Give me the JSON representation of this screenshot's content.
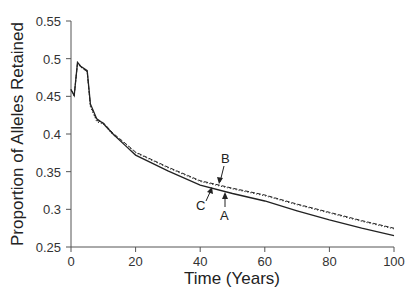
{
  "chart_data": {
    "type": "line",
    "title": "",
    "xlabel": "Time (Years)",
    "ylabel": "Proportion of Alleles Retained",
    "xlim": [
      0,
      100
    ],
    "ylim": [
      0.25,
      0.55
    ],
    "xticks": [
      0,
      20,
      40,
      60,
      80,
      100
    ],
    "yticks": [
      0.25,
      0.3,
      0.35,
      0.4,
      0.45,
      0.5,
      0.55
    ],
    "xtick_labels": [
      "0",
      "20",
      "40",
      "60",
      "80",
      "100"
    ],
    "ytick_labels": [
      "0.25",
      "0.3",
      "0.35",
      "0.4",
      "0.45",
      "0.5",
      "0.55"
    ],
    "grid": false,
    "legend": null,
    "x": [
      0,
      1,
      2,
      3,
      5,
      6,
      8,
      10,
      13,
      17,
      20,
      30,
      40,
      50,
      60,
      70,
      80,
      90,
      100
    ],
    "series": [
      {
        "name": "A",
        "style": "solid",
        "values": [
          0.459,
          0.451,
          0.495,
          0.49,
          0.484,
          0.44,
          0.42,
          0.414,
          0.4,
          0.384,
          0.372,
          0.351,
          0.332,
          0.321,
          0.311,
          0.298,
          0.286,
          0.275,
          0.265
        ]
      },
      {
        "name": "B",
        "style": "dashed",
        "values": [
          0.459,
          0.451,
          0.494,
          0.489,
          0.483,
          0.438,
          0.418,
          0.415,
          0.401,
          0.387,
          0.376,
          0.356,
          0.338,
          0.328,
          0.319,
          0.307,
          0.296,
          0.285,
          0.275
        ]
      },
      {
        "name": "C",
        "style": "dotted",
        "values": [
          0.459,
          0.451,
          0.494,
          0.489,
          0.482,
          0.436,
          0.416,
          0.413,
          0.399,
          0.386,
          0.375,
          0.355,
          0.337,
          0.327,
          0.318,
          0.306,
          0.295,
          0.284,
          0.274
        ]
      }
    ],
    "annotations": [
      {
        "label": "A",
        "x": 48,
        "y": 0.326
      },
      {
        "label": "B",
        "x": 47,
        "y": 0.334
      },
      {
        "label": "C",
        "x": 43,
        "y": 0.332
      }
    ]
  }
}
